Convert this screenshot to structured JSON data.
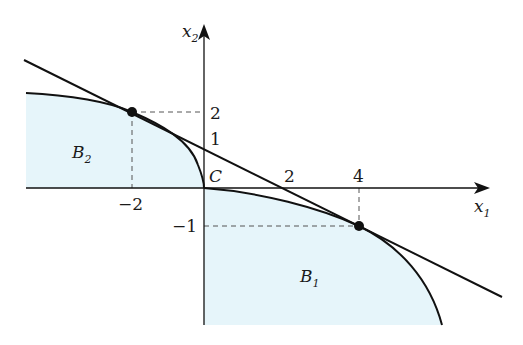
{
  "diagram": {
    "colors": {
      "fill": "#e6f5fa",
      "stroke": "#111111",
      "dashed": "#555555"
    },
    "axes": {
      "x_label": "x",
      "x_sub": "1",
      "y_label": "x",
      "y_sub": "2"
    },
    "ticks": {
      "x_neg2": "−2",
      "x_2": "2",
      "x_4": "4",
      "y_2": "2",
      "y_1": "1",
      "y_neg1": "−1"
    },
    "origin_label": "C",
    "regions": {
      "b1": {
        "label": "B",
        "sub": "1"
      },
      "b2": {
        "label": "B",
        "sub": "2"
      }
    },
    "points": [
      {
        "name": "tangent-point-b2",
        "x": -2,
        "y": 2
      },
      {
        "name": "tangent-point-b1",
        "x": 4,
        "y": -1
      }
    ],
    "separating_line": {
      "equation": "x1 + 2 x2 = 2"
    }
  }
}
